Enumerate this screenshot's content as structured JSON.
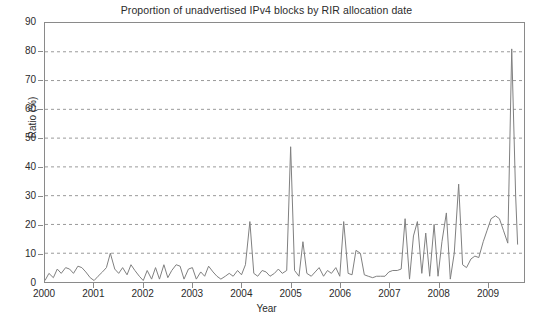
{
  "chart_data": {
    "type": "line",
    "title": "Proportion of unadvertised IPv4 blocks by RIR allocation date",
    "xlabel": "Year",
    "ylabel": "Ratio (%)",
    "xlim": [
      2000,
      2009.75
    ],
    "ylim": [
      0,
      90
    ],
    "ytick_labels": [
      "0",
      "10",
      "20",
      "30",
      "40",
      "50",
      "60",
      "70",
      "80",
      "90"
    ],
    "ytick_values": [
      0,
      10,
      20,
      30,
      40,
      50,
      60,
      70,
      80,
      90
    ],
    "xtick_labels": [
      "2000",
      "2001",
      "2002",
      "2003",
      "2004",
      "2005",
      "2006",
      "2007",
      "2008",
      "2009"
    ],
    "xtick_values": [
      2000,
      2001,
      2002,
      2003,
      2004,
      2005,
      2006,
      2007,
      2008,
      2009
    ],
    "grid": "horizontal-dashed",
    "legend": "none",
    "line_color": "#808080",
    "series": [
      {
        "name": "Unadvertised ratio",
        "x": [
          2000.0,
          2000.08,
          2000.17,
          2000.25,
          2000.33,
          2000.42,
          2000.5,
          2000.58,
          2000.67,
          2000.75,
          2000.83,
          2000.92,
          2001.0,
          2001.08,
          2001.17,
          2001.25,
          2001.33,
          2001.42,
          2001.5,
          2001.58,
          2001.67,
          2001.75,
          2001.83,
          2001.92,
          2002.0,
          2002.08,
          2002.17,
          2002.25,
          2002.33,
          2002.42,
          2002.5,
          2002.58,
          2002.67,
          2002.75,
          2002.83,
          2002.92,
          2003.0,
          2003.08,
          2003.17,
          2003.25,
          2003.33,
          2003.42,
          2003.5,
          2003.58,
          2003.67,
          2003.75,
          2003.83,
          2003.92,
          2004.0,
          2004.08,
          2004.17,
          2004.25,
          2004.33,
          2004.42,
          2004.5,
          2004.58,
          2004.67,
          2004.75,
          2004.83,
          2004.92,
          2005.0,
          2005.08,
          2005.17,
          2005.25,
          2005.33,
          2005.42,
          2005.5,
          2005.58,
          2005.67,
          2005.75,
          2005.83,
          2005.92,
          2006.0,
          2006.08,
          2006.17,
          2006.25,
          2006.33,
          2006.42,
          2006.5,
          2006.58,
          2006.67,
          2006.75,
          2006.83,
          2006.92,
          2007.0,
          2007.08,
          2007.17,
          2007.25,
          2007.33,
          2007.42,
          2007.5,
          2007.58,
          2007.67,
          2007.75,
          2007.83,
          2007.92,
          2008.0,
          2008.08,
          2008.17,
          2008.25,
          2008.33,
          2008.42,
          2008.5,
          2008.58,
          2008.67,
          2008.75,
          2008.83,
          2008.92,
          2009.0,
          2009.08,
          2009.17,
          2009.25,
          2009.33,
          2009.42,
          2009.5,
          2009.58,
          2009.62
        ],
        "y": [
          0.5,
          3.0,
          1.5,
          4.5,
          3.0,
          5.0,
          4.5,
          3.0,
          5.5,
          5.0,
          3.5,
          1.5,
          0.5,
          2.0,
          3.5,
          5.0,
          10.0,
          4.5,
          3.0,
          5.0,
          2.5,
          6.0,
          4.0,
          2.0,
          0.5,
          4.0,
          1.0,
          5.0,
          1.0,
          6.0,
          1.5,
          4.0,
          6.0,
          5.5,
          1.0,
          4.5,
          5.0,
          1.0,
          3.5,
          2.0,
          5.5,
          3.5,
          2.0,
          1.0,
          2.0,
          3.0,
          2.0,
          4.0,
          2.5,
          6.0,
          21.0,
          3.0,
          2.0,
          4.0,
          3.5,
          2.0,
          3.0,
          4.5,
          3.0,
          4.0,
          47.0,
          4.0,
          2.0,
          14.0,
          3.0,
          2.0,
          3.5,
          5.0,
          2.0,
          4.0,
          3.0,
          5.0,
          2.0,
          21.0,
          3.0,
          2.5,
          11.0,
          10.0,
          2.5,
          2.0,
          1.5,
          2.0,
          2.0,
          2.0,
          3.5,
          4.0,
          4.0,
          4.5,
          22.0,
          1.0,
          16.0,
          21.0,
          3.0,
          17.0,
          2.0,
          20.0,
          2.0,
          14.0,
          24.0,
          1.0,
          10.0,
          34.0,
          6.0,
          5.0,
          8.0,
          9.0,
          8.5,
          14.0,
          18.0,
          22.0,
          23.0,
          22.0,
          18.0,
          13.5,
          81.0,
          30.0,
          13.0
        ]
      }
    ]
  }
}
